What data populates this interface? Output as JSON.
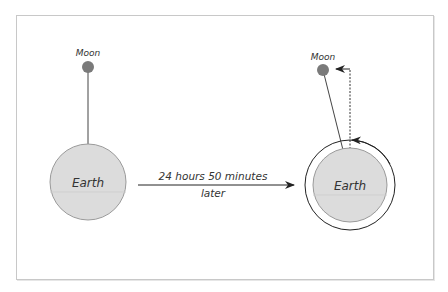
{
  "diagram": {
    "left": {
      "moon_label": "Moon",
      "earth_label": "Earth"
    },
    "right": {
      "moon_label": "Moon",
      "earth_label": "Earth"
    },
    "transition": {
      "line1": "24 hours 50 minutes",
      "line2": "later"
    }
  },
  "colors": {
    "earth_fill": "#dcdcdc",
    "earth_stroke": "#9a9a9a",
    "moon_fill": "#7a7a7a",
    "line": "#333333",
    "frame": "#c8c8c8"
  }
}
